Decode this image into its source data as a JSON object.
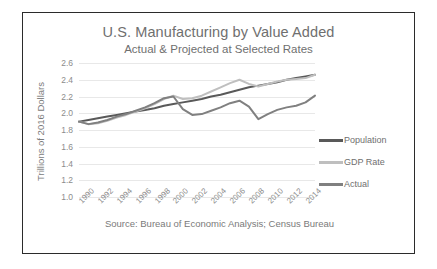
{
  "chart_data": {
    "type": "line",
    "title": "U.S. Manufacturing by Value Added",
    "subtitle": "Actual & Projected at Selected Rates",
    "xlabel": "",
    "ylabel": "Trillions of 2016 Dollars",
    "source": "Source: Bureau of Economic Analysis; Census Bureau",
    "ylim": [
      1.0,
      2.6
    ],
    "yticks": [
      "2.6",
      "2.4",
      "2.2",
      "2.0",
      "1.8",
      "1.6",
      "1.4",
      "1.2",
      "1.0"
    ],
    "xlim": [
      1990,
      2015
    ],
    "grid": true,
    "legend_position": "right",
    "x": [
      1990,
      1991,
      1992,
      1993,
      1994,
      1995,
      1996,
      1997,
      1998,
      1999,
      2000,
      2001,
      2002,
      2003,
      2004,
      2005,
      2006,
      2007,
      2008,
      2009,
      2010,
      2011,
      2012,
      2013,
      2014,
      2015
    ],
    "xticks": [
      "1990",
      "1992",
      "1994",
      "1996",
      "1998",
      "2000",
      "2002",
      "2004",
      "2006",
      "2008",
      "2010",
      "2012",
      "2014"
    ],
    "series": [
      {
        "name": "Population",
        "color": "#595959",
        "values": [
          1.9,
          1.92,
          1.94,
          1.96,
          1.98,
          2.0,
          2.02,
          2.04,
          2.06,
          2.09,
          2.11,
          2.13,
          2.15,
          2.17,
          2.2,
          2.22,
          2.25,
          2.28,
          2.31,
          2.33,
          2.35,
          2.37,
          2.4,
          2.42,
          2.44,
          2.46
        ]
      },
      {
        "name": "GDP Rate",
        "color": "#bfbfbf",
        "values": [
          1.9,
          1.87,
          1.88,
          1.91,
          1.95,
          1.98,
          2.02,
          2.06,
          2.11,
          2.17,
          2.21,
          2.17,
          2.18,
          2.21,
          2.26,
          2.31,
          2.36,
          2.4,
          2.35,
          2.32,
          2.35,
          2.38,
          2.4,
          2.41,
          2.42,
          2.46
        ]
      },
      {
        "name": "Actual",
        "color": "#808080",
        "values": [
          1.9,
          1.87,
          1.89,
          1.92,
          1.96,
          1.99,
          2.03,
          2.07,
          2.12,
          2.18,
          2.2,
          2.05,
          1.98,
          1.99,
          2.03,
          2.07,
          2.12,
          2.15,
          2.08,
          1.93,
          1.99,
          2.04,
          2.07,
          2.09,
          2.13,
          2.21
        ]
      }
    ]
  },
  "legend": [
    {
      "label": "Population",
      "color": "#595959"
    },
    {
      "label": "GDP Rate",
      "color": "#bfbfbf"
    },
    {
      "label": "Actual",
      "color": "#808080"
    }
  ]
}
